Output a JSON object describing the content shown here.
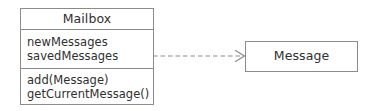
{
  "diagram": {
    "type": "uml-class-diagram",
    "background_color": "#ffffff",
    "border_color": "#8b8b8b",
    "text_color": "#2f2f2f",
    "classes": [
      {
        "id": "mailbox",
        "name": "Mailbox",
        "attributes": [
          "newMessages",
          "savedMessages"
        ],
        "methods": [
          "add(Message)",
          "getCurrentMessage()"
        ]
      },
      {
        "id": "message",
        "name": "Message",
        "attributes": [],
        "methods": []
      }
    ],
    "relationships": [
      {
        "id": "mailbox-depends-on-message",
        "kind": "dependency",
        "line_style": "dashed",
        "arrowhead": "open",
        "source": "Mailbox",
        "target": "Message",
        "label": ""
      }
    ]
  }
}
